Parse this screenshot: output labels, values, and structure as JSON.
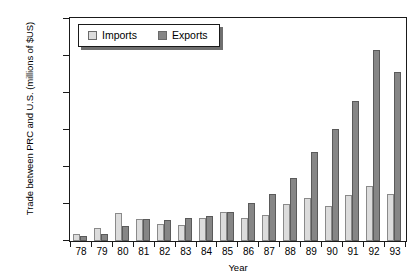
{
  "chart_data": {
    "type": "bar",
    "title": "",
    "xlabel": "Year",
    "ylabel": "Trade between PRC and U.S. (millions of $US)",
    "categories": [
      "78",
      "79",
      "80",
      "81",
      "82",
      "83",
      "84",
      "85",
      "86",
      "87",
      "88",
      "89",
      "90",
      "91",
      "92",
      "93"
    ],
    "ylim": [
      0,
      30000
    ],
    "ytick_labels": [
      "30,000",
      "25,000",
      "20,000",
      "15,000",
      "10,000",
      "5,000",
      "0"
    ],
    "ytick_values": [
      30000,
      25000,
      20000,
      15000,
      10000,
      5000,
      0
    ],
    "grid": false,
    "legend_position": "top-left",
    "series": [
      {
        "name": "Imports",
        "color": "#dcdcdc",
        "values": [
          1000,
          1700,
          3800,
          3000,
          2300,
          2200,
          3100,
          3900,
          3100,
          3500,
          5000,
          5800,
          4800,
          6200,
          7500,
          6300
        ]
      },
      {
        "name": "Exports",
        "color": "#868686",
        "values": [
          700,
          1000,
          2000,
          3000,
          2900,
          3100,
          3400,
          3900,
          5200,
          6300,
          8500,
          12100,
          15200,
          19000,
          25800,
          22900
        ]
      }
    ]
  },
  "legend": {
    "items": [
      {
        "label": "Imports",
        "swatch": "imports-swatch"
      },
      {
        "label": "Exports",
        "swatch": "exports-swatch"
      }
    ]
  },
  "top_caption": ""
}
